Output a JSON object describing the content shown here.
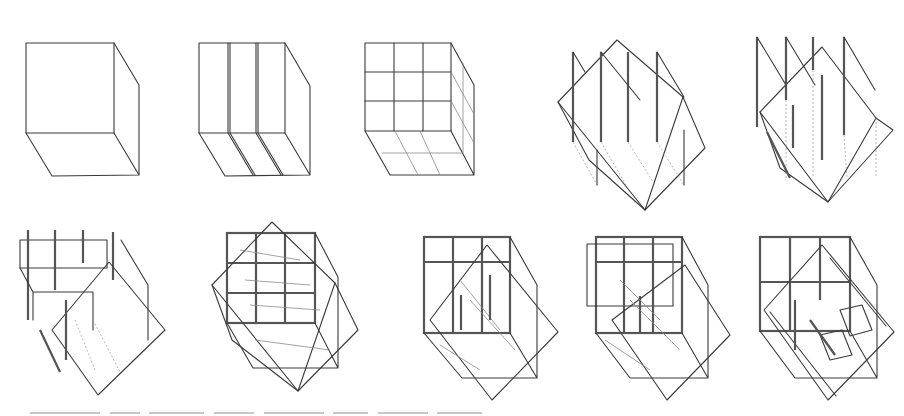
{
  "figure": {
    "rows": [
      {
        "panels": [
          {
            "id": 1,
            "label": "solid cube"
          },
          {
            "id": 2,
            "label": "cube divided into three vertical slabs"
          },
          {
            "id": 3,
            "label": "cube gridded 3x3"
          },
          {
            "id": 4,
            "label": "rotated square plane intersecting vertical walls"
          },
          {
            "id": 5,
            "label": "rotated planes with offset walls"
          }
        ]
      },
      {
        "panels": [
          {
            "id": 6,
            "label": "frame with rotated plane"
          },
          {
            "id": 7,
            "label": "gridded cube overlaid with rotated square"
          },
          {
            "id": 8,
            "label": "frame cube with diagonal plane"
          },
          {
            "id": 9,
            "label": "layered frame with diagonal plane"
          },
          {
            "id": 10,
            "label": "final composition"
          }
        ]
      }
    ],
    "caption": {
      "visible": "partially cut off at bottom edge (illegible)"
    },
    "colors": {
      "background": "#ffffff",
      "ink": "#3a3a3a",
      "ink_light": "#8a8a8a"
    }
  }
}
